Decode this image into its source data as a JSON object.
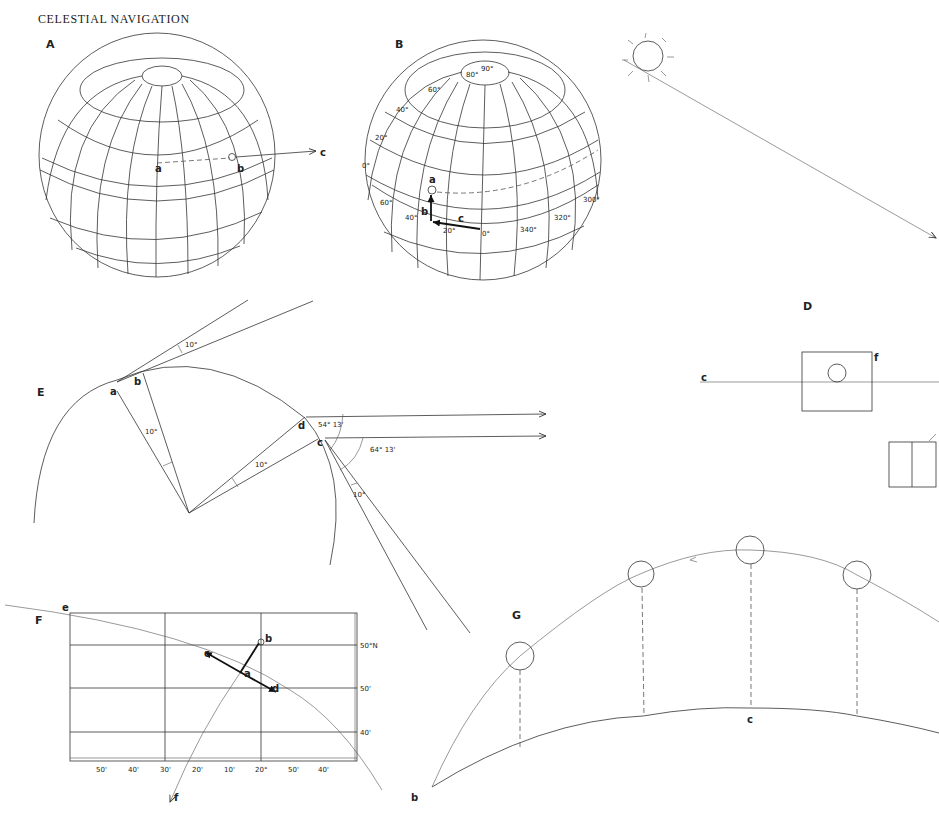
{
  "title": "CELESTIAL NAVIGATION",
  "panels": {
    "A": {
      "label": "A",
      "points": {
        "a": "a",
        "b": "b",
        "c": "c"
      }
    },
    "B": {
      "label": "B",
      "latitudes": [
        "90°",
        "80°",
        "60°",
        "40°",
        "20°",
        "0°"
      ],
      "longitude_left": [
        "60°",
        "40°",
        "20°"
      ],
      "longitude_bottom": [
        "0°",
        "340°",
        "320°",
        "300°"
      ],
      "lat_labels": {
        "l90": "90°",
        "l80": "80°",
        "l60": "60°",
        "l40": "40°",
        "l20": "20°",
        "l0": "0°"
      },
      "lon_labels": {
        "w60": "60°",
        "w40": "40°",
        "w20": "20°",
        "m0": "0°",
        "e340": "340°",
        "e320": "320°",
        "e300": "300°"
      },
      "points": {
        "a": "a",
        "b": "b",
        "c": "c"
      }
    },
    "C_sun": {
      "icon": "sun-icon"
    },
    "D": {
      "label": "D",
      "points": {
        "c": "c",
        "f": "f"
      }
    },
    "E": {
      "label": "E",
      "points": {
        "a": "a",
        "b": "b",
        "c": "c",
        "d": "d"
      },
      "angles": {
        "top": "10°",
        "ab": "10°",
        "cd": "10°",
        "lower": "10°",
        "d_angle": "54° 13'",
        "c_angle": "64° 13'"
      }
    },
    "F": {
      "label": "F",
      "points": {
        "a": "a",
        "b": "b",
        "c": "c",
        "d": "d",
        "e": "e",
        "f": "f"
      },
      "lat_labels": [
        "50°N",
        "50'",
        "40'"
      ],
      "lon_labels": [
        "50'",
        "40'",
        "30'",
        "20'",
        "10'",
        "20°",
        "50'",
        "40'"
      ]
    },
    "G": {
      "label": "G",
      "points": {
        "b": "b",
        "c": "c"
      }
    }
  }
}
